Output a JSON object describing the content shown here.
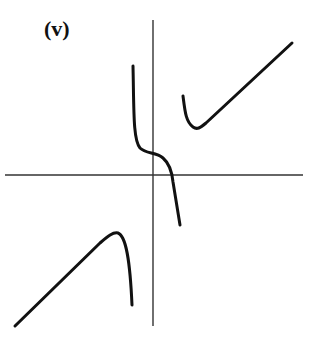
{
  "figure": {
    "label": "(v)",
    "stroke_color": "#111111",
    "axis_color": "#333333"
  },
  "axes": {
    "x_axis": {
      "y": 175,
      "x_start": 5,
      "x_end": 303
    },
    "y_axis": {
      "x": 153,
      "y_start": 20,
      "y_end": 326
    }
  },
  "curves": [
    {
      "name": "middle-s-branch",
      "path": "M133,66 C134,110 133,140 140,148 C146,154 156,152 163,158 C170,164 172,172 173,182 L180,225"
    },
    {
      "name": "upper-right-branch",
      "path": "M183,96 C185,112 186,122 193,127 C197,130 200,128 206,123 L292,43"
    },
    {
      "name": "lower-left-branch",
      "path": "M15,326 L100,243 C108,236 113,232 118,233 C126,236 130,260 132,305"
    }
  ]
}
